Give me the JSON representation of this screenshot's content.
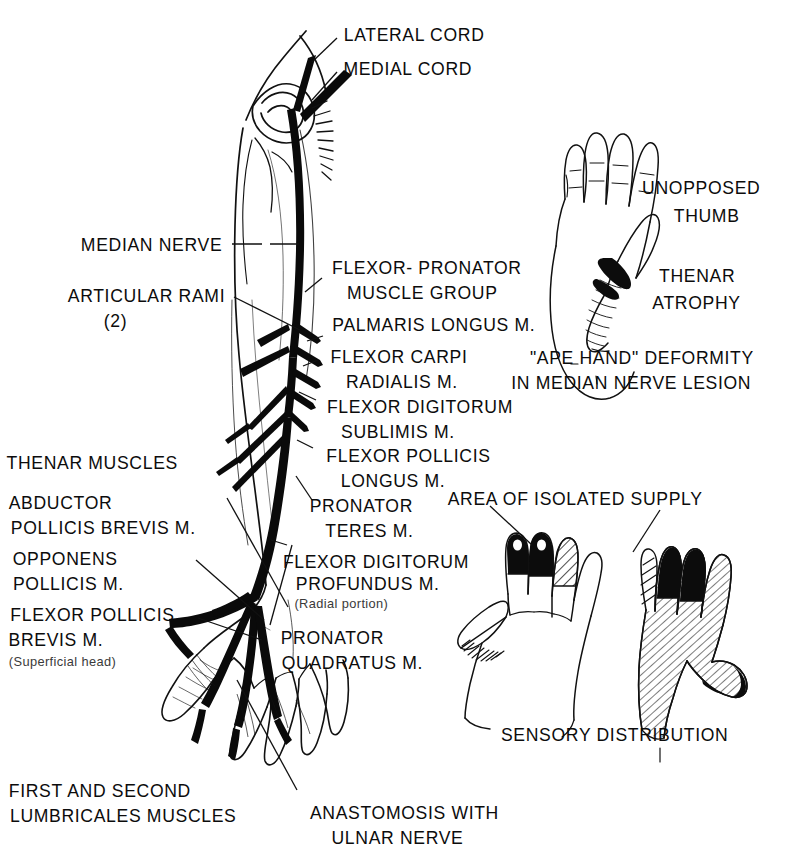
{
  "figure": {
    "ink_color": "#0c0c0c",
    "background": "#ffffff"
  },
  "labels": {
    "lateral_cord": "LATERAL CORD",
    "medial_cord": "MEDIAL CORD",
    "median_nerve": "MEDIAN NERVE",
    "articular_rami": "ARTICULAR RAMI",
    "articular_rami_count": "(2)",
    "flexor_pronator_1": "FLEXOR- PRONATOR",
    "flexor_pronator_2": "MUSCLE GROUP",
    "palmaris_longus": "PALMARIS LONGUS M.",
    "flexor_carpi_1": "FLEXOR CARPI",
    "flexor_carpi_2": "RADIALIS M.",
    "flexor_dig_sub_1": "FLEXOR DIGITORUM",
    "flexor_dig_sub_2": "SUBLIMIS M.",
    "flexor_poll_long_1": "FLEXOR POLLICIS",
    "flexor_poll_long_2": "LONGUS M.",
    "pronator_teres_1": "PRONATOR",
    "pronator_teres_2": "TERES M.",
    "flexor_dig_prof_1": "FLEXOR DIGITORUM",
    "flexor_dig_prof_2": "PROFUNDUS M.",
    "flexor_dig_prof_3": "(Radial portion)",
    "pronator_quad_1": "PRONATOR",
    "pronator_quad_2": "QUADRATUS M.",
    "thenar_muscles": "THENAR MUSCLES",
    "abductor_1": "ABDUCTOR",
    "abductor_2": "POLLICIS BREVIS M.",
    "opponens_1": "OPPONENS",
    "opponens_2": "POLLICIS M.",
    "flexor_poll_brev_1": "FLEXOR POLLICIS",
    "flexor_poll_brev_2": "BREVIS M.",
    "flexor_poll_brev_3": "(Superficial head)",
    "lumbricales_1": "FIRST AND SECOND",
    "lumbricales_2": "LUMBRICALES MUSCLES",
    "anastomosis_1": "ANASTOMOSIS WITH",
    "anastomosis_2": "ULNAR NERVE",
    "unopposed_thumb_1": "UNOPPOSED",
    "unopposed_thumb_2": "THUMB",
    "thenar_atrophy_1": "THENAR",
    "thenar_atrophy_2": "ATROPHY",
    "ape_hand_1": "\"APE HAND\" DEFORMITY",
    "ape_hand_2": "IN MEDIAN NERVE LESION",
    "area_isolated_supply": "AREA OF ISOLATED SUPPLY",
    "sensory_distribution": "SENSORY DISTRIBUTION"
  },
  "panels": [
    {
      "name": "arm-median-nerve-illustration",
      "caption": null
    },
    {
      "name": "ape-hand-illustration",
      "caption": "\"APE HAND\" DEFORMITY IN MEDIAN NERVE LESION"
    },
    {
      "name": "sensory-hands-illustration",
      "caption": "SENSORY DISTRIBUTION"
    }
  ]
}
